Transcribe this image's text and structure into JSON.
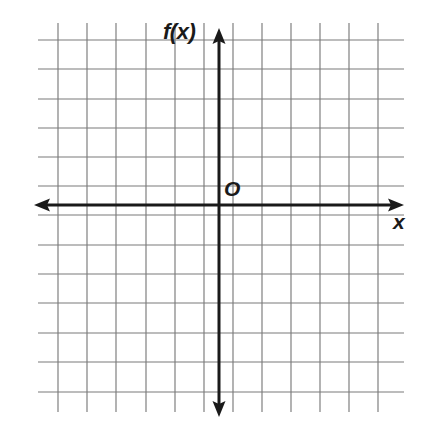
{
  "figure": {
    "kind": "coordinate-plane",
    "background_color": "#ffffff",
    "width": 425,
    "height": 442
  },
  "labels": {
    "y_axis": "f(x)",
    "x_axis": "x",
    "origin": "O"
  },
  "icons": {
    "arrow_up": "arrow-up-icon",
    "arrow_down": "arrow-down-icon",
    "arrow_left": "arrow-left-icon",
    "arrow_right": "arrow-right-icon"
  },
  "chart_data": {
    "type": "line",
    "title": "",
    "subtitle": "",
    "xlabel": "x",
    "ylabel": "f(x)",
    "series": [],
    "annotations": [
      {
        "text": "f(x)",
        "role": "y-axis-label",
        "x_px": 163,
        "y_px": 21
      },
      {
        "text": "O",
        "role": "origin-label",
        "x_px": 224,
        "y_px": 178
      },
      {
        "text": "x",
        "role": "x-axis-label",
        "x_px": 393,
        "y_px": 211
      }
    ],
    "grid": true,
    "grid_color": "#7a7a7a",
    "grid_spacing_px": 29.2,
    "grid_columns": 12,
    "grid_rows": 13,
    "legend": "none",
    "axis_color": "#1a1a1a",
    "origin_px": {
      "x": 219,
      "y": 205
    },
    "xlim": [
      -7.5,
      6.5
    ],
    "ylim": [
      -7.5,
      6.5
    ],
    "xticks": [
      -7,
      -6,
      -5,
      -4,
      -3,
      -2,
      -1,
      0,
      1,
      2,
      3,
      4,
      5,
      6
    ],
    "yticks": [
      -7,
      -6,
      -5,
      -4,
      -3,
      -2,
      -1,
      0,
      1,
      2,
      3,
      4,
      5,
      6
    ],
    "xticklabels": [],
    "yticklabels": [],
    "data_points": [],
    "values": [],
    "categories": [],
    "gridlines": {
      "vertical_x_px": [
        58,
        87,
        116,
        146,
        175,
        204,
        233,
        262,
        291,
        320,
        349,
        378
      ],
      "horizontal_y_px": [
        40,
        69,
        99,
        128,
        157,
        186,
        215,
        245,
        274,
        303,
        333,
        362,
        392
      ],
      "vertical_top_px": 23,
      "vertical_bottom_px": 412,
      "horizontal_left_px": 38,
      "horizontal_right_px": 404
    },
    "axes": {
      "x_axis": {
        "y_px": 205,
        "x_start_px": 34,
        "x_end_px": 404,
        "arrows": "both"
      },
      "y_axis": {
        "x_px": 219,
        "y_start_px": 28,
        "y_end_px": 417,
        "arrows": "both"
      }
    }
  }
}
